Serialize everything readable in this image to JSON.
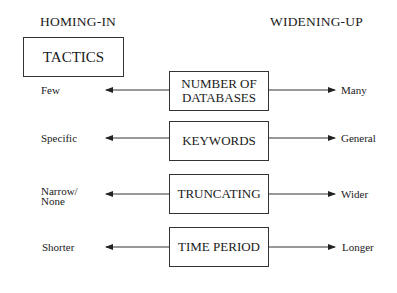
{
  "headings": {
    "left": "HOMING-IN",
    "right": "WIDENING-UP"
  },
  "title_box": "TACTICS",
  "rows": [
    {
      "center": "NUMBER OF\nDATABASES",
      "left": "Few",
      "right": "Many"
    },
    {
      "center": "KEYWORDS",
      "left": "Specific",
      "right": "General"
    },
    {
      "center": "TRUNCATING",
      "left": "Narrow/\nNone",
      "right": "Wider"
    },
    {
      "center": "TIME PERIOD",
      "left": "Shorter",
      "right": "Longer"
    }
  ]
}
